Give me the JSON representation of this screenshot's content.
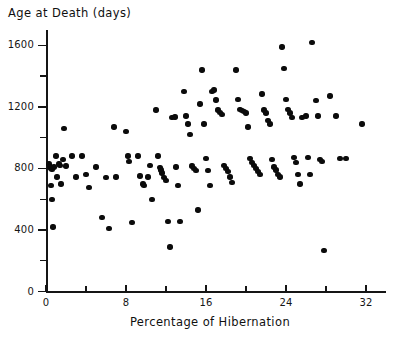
{
  "chart_data": {
    "type": "scatter",
    "title": "",
    "ylabel": "Age at Death (days)",
    "xlabel": "Percentage of Hibernation",
    "xlim": [
      0,
      34
    ],
    "ylim": [
      0,
      1700
    ],
    "xticks": [
      0,
      8,
      16,
      24,
      32
    ],
    "xminorticks": [
      4,
      12,
      20,
      28
    ],
    "yticks": [
      0,
      400,
      800,
      1200,
      1600
    ],
    "yminorticks": [
      200,
      600,
      1000,
      1400
    ],
    "xtick_labels": [
      "0",
      "8",
      "16",
      "24",
      "32"
    ],
    "ytick_labels": [
      "0",
      "400",
      "800",
      "1200",
      "1600"
    ],
    "grid": false,
    "legend": null,
    "marker": "filled-circle",
    "marker_color": "#0b0b0b",
    "points": [
      [
        0.3,
        830
      ],
      [
        0.4,
        810
      ],
      [
        0.5,
        800
      ],
      [
        0.6,
        795
      ],
      [
        0.8,
        810
      ],
      [
        0.5,
        690
      ],
      [
        0.6,
        600
      ],
      [
        0.7,
        420
      ],
      [
        1.0,
        880
      ],
      [
        1.1,
        745
      ],
      [
        1.3,
        830
      ],
      [
        1.4,
        820
      ],
      [
        1.5,
        700
      ],
      [
        1.7,
        860
      ],
      [
        1.8,
        1060
      ],
      [
        2.0,
        815
      ],
      [
        2.6,
        880
      ],
      [
        3.0,
        745
      ],
      [
        3.6,
        880
      ],
      [
        4.0,
        760
      ],
      [
        4.3,
        675
      ],
      [
        5.0,
        810
      ],
      [
        5.6,
        480
      ],
      [
        6.0,
        740
      ],
      [
        6.3,
        410
      ],
      [
        6.8,
        1070
      ],
      [
        7.0,
        745
      ],
      [
        8.0,
        1040
      ],
      [
        8.2,
        880
      ],
      [
        8.3,
        845
      ],
      [
        8.6,
        450
      ],
      [
        9.2,
        880
      ],
      [
        9.4,
        750
      ],
      [
        9.7,
        700
      ],
      [
        9.8,
        690
      ],
      [
        10.2,
        745
      ],
      [
        10.4,
        820
      ],
      [
        10.6,
        600
      ],
      [
        11.0,
        1180
      ],
      [
        11.2,
        880
      ],
      [
        11.4,
        805
      ],
      [
        11.5,
        790
      ],
      [
        11.6,
        770
      ],
      [
        11.8,
        740
      ],
      [
        12.0,
        720
      ],
      [
        12.2,
        455
      ],
      [
        12.4,
        290
      ],
      [
        12.6,
        1130
      ],
      [
        12.9,
        1135
      ],
      [
        13.0,
        810
      ],
      [
        13.2,
        690
      ],
      [
        13.4,
        455
      ],
      [
        13.8,
        1300
      ],
      [
        14.0,
        1140
      ],
      [
        14.2,
        1090
      ],
      [
        14.4,
        1020
      ],
      [
        14.6,
        815
      ],
      [
        14.8,
        800
      ],
      [
        15.0,
        785
      ],
      [
        15.2,
        530
      ],
      [
        15.4,
        1220
      ],
      [
        15.6,
        1440
      ],
      [
        15.8,
        1090
      ],
      [
        16.0,
        865
      ],
      [
        16.2,
        785
      ],
      [
        16.4,
        690
      ],
      [
        16.6,
        1300
      ],
      [
        16.8,
        1310
      ],
      [
        17.0,
        1245
      ],
      [
        17.2,
        1180
      ],
      [
        17.4,
        1165
      ],
      [
        17.6,
        1150
      ],
      [
        17.8,
        820
      ],
      [
        18.0,
        800
      ],
      [
        18.2,
        780
      ],
      [
        18.4,
        745
      ],
      [
        18.6,
        710
      ],
      [
        19.0,
        1440
      ],
      [
        19.2,
        1250
      ],
      [
        19.4,
        1185
      ],
      [
        19.6,
        1175
      ],
      [
        19.8,
        1170
      ],
      [
        20.0,
        1160
      ],
      [
        20.2,
        1070
      ],
      [
        20.4,
        865
      ],
      [
        20.6,
        840
      ],
      [
        20.8,
        820
      ],
      [
        21.0,
        800
      ],
      [
        21.2,
        780
      ],
      [
        21.4,
        760
      ],
      [
        21.6,
        1285
      ],
      [
        21.8,
        1180
      ],
      [
        22.0,
        1160
      ],
      [
        22.2,
        1110
      ],
      [
        22.4,
        1090
      ],
      [
        22.6,
        860
      ],
      [
        22.8,
        810
      ],
      [
        23.0,
        790
      ],
      [
        23.2,
        760
      ],
      [
        23.4,
        745
      ],
      [
        23.6,
        1590
      ],
      [
        23.8,
        1450
      ],
      [
        24.0,
        1250
      ],
      [
        24.2,
        1185
      ],
      [
        24.4,
        1160
      ],
      [
        24.6,
        1130
      ],
      [
        24.8,
        870
      ],
      [
        25.0,
        840
      ],
      [
        25.2,
        760
      ],
      [
        25.4,
        700
      ],
      [
        25.6,
        1130
      ],
      [
        26.0,
        1140
      ],
      [
        26.2,
        870
      ],
      [
        26.4,
        760
      ],
      [
        26.6,
        1620
      ],
      [
        27.0,
        1240
      ],
      [
        27.2,
        1140
      ],
      [
        27.4,
        860
      ],
      [
        27.6,
        845
      ],
      [
        27.8,
        265
      ],
      [
        28.4,
        1270
      ],
      [
        29.0,
        1140
      ],
      [
        29.4,
        865
      ],
      [
        30.0,
        865
      ],
      [
        31.6,
        1090
      ]
    ]
  }
}
